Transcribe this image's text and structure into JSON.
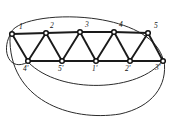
{
  "figure": {
    "width": 173,
    "height": 122,
    "background_color": "#ffffff",
    "line_color": "#1a1a1a",
    "arc_color": "#2b2b2b",
    "node_fill_color": "#ffffff"
  },
  "top_nodes": [
    {
      "id": "t1",
      "label": "1",
      "cx": 12,
      "cy": 34,
      "label_x": 19,
      "label_y": 29
    },
    {
      "id": "t2",
      "label": "2",
      "cx": 46,
      "cy": 33,
      "label_x": 50,
      "label_y": 28
    },
    {
      "id": "t3",
      "label": "3",
      "cx": 80,
      "cy": 32,
      "label_x": 85,
      "label_y": 27
    },
    {
      "id": "t4",
      "label": "4",
      "cx": 114,
      "cy": 32,
      "label_x": 119,
      "label_y": 27
    },
    {
      "id": "t5",
      "label": "5",
      "cx": 148,
      "cy": 33,
      "label_x": 154,
      "label_y": 28
    }
  ],
  "bottom_nodes": [
    {
      "id": "b4",
      "label": "4'",
      "cx": 28,
      "cy": 61,
      "label_x": 23,
      "label_y": 71
    },
    {
      "id": "b5",
      "label": "5'",
      "cx": 62,
      "cy": 61,
      "label_x": 58,
      "label_y": 71
    },
    {
      "id": "b1",
      "label": "1'",
      "cx": 96,
      "cy": 61,
      "label_x": 92,
      "label_y": 71
    },
    {
      "id": "b2",
      "label": "2'",
      "cx": 130,
      "cy": 61,
      "label_x": 125,
      "label_y": 71
    },
    {
      "id": "b3",
      "label": "3'",
      "cx": 163,
      "cy": 61,
      "label_x": 155,
      "label_y": 70
    }
  ],
  "top_rail": {
    "name": "top-rail-path",
    "d": "M 12 34 L 46 33 L 80 32 L 114 32 L 148 33"
  },
  "bottom_rail": {
    "name": "bottom-rail-path",
    "d": "M 28 61 L 62 61 L 96 61 L 130 61 L 163 61"
  },
  "diagonals": [
    {
      "name": "edge-1-4p",
      "d": "M 12 34 L 28 61"
    },
    {
      "name": "edge-2-4p",
      "d": "M 46 33 L 28 61"
    },
    {
      "name": "edge-2-5p",
      "d": "M 46 33 L 62 61"
    },
    {
      "name": "edge-3-5p",
      "d": "M 80 32 L 62 61"
    },
    {
      "name": "edge-3-1p",
      "d": "M 80 32 L 96 61"
    },
    {
      "name": "edge-4-1p",
      "d": "M 114 32 L 96 61"
    },
    {
      "name": "edge-4-2p",
      "d": "M 114 32 L 130 61"
    },
    {
      "name": "edge-5-2p",
      "d": "M 148 33 L 130 61"
    },
    {
      "name": "edge-5-3p",
      "d": "M 148 33 L 163 61"
    }
  ],
  "arcs": [
    {
      "name": "arc-top-identification",
      "d": "M 10 35 C 14 9, 148 6, 163 59"
    },
    {
      "name": "arc-left-identification",
      "d": "M 10 35 C 1 52, 10 72, 28 62"
    },
    {
      "name": "arc-inner-bottom",
      "d": "M 28 62 C 60 95, 140 92, 163 60"
    },
    {
      "name": "arc-outer-bottom",
      "d": "M 10 36 C 8 100, 70 122, 120 114 C 152 107, 168 86, 164 60"
    }
  ]
}
